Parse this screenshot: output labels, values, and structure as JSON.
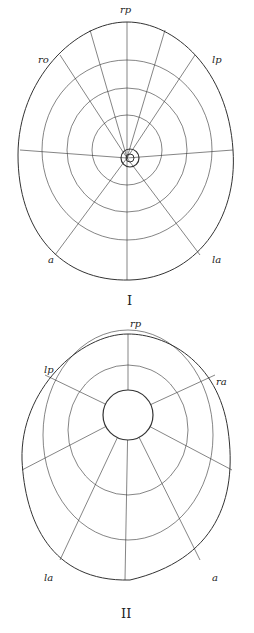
{
  "figures": [
    {
      "id": "I",
      "caption": "I",
      "labels": {
        "top": "rp",
        "upper_left": "ro",
        "upper_right": "lp",
        "lower_left": "a",
        "lower_right": "la"
      },
      "description": "Oral view of echinoid test showing ambulacral and interambulacral plates radiating from the central peristome"
    },
    {
      "id": "II",
      "caption": "II",
      "labels": {
        "top": "rp",
        "upper_left": "lp",
        "upper_right": "ra",
        "lower_left": "la",
        "lower_right": "a"
      },
      "description": "Aboral view of echinoid test with large central apical opening and plate rows"
    }
  ],
  "colors": {
    "ink": "#222222",
    "paper": "#ffffff"
  }
}
